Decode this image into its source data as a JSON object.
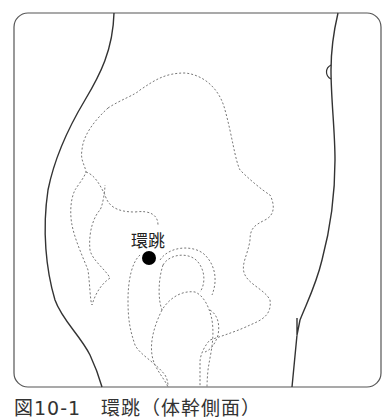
{
  "figure": {
    "point_label": "環跳",
    "caption": "図10-1　環跳（体幹側面）",
    "colors": {
      "outline": "#333333",
      "dashed": "#777777",
      "point": "#000000"
    }
  }
}
